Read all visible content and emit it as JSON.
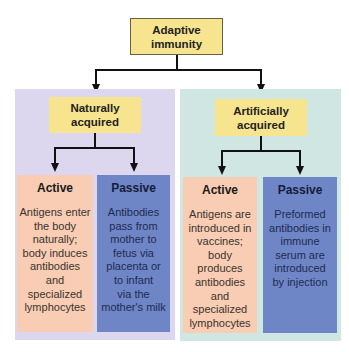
{
  "diagram": {
    "root": {
      "label": "Adaptive\nimmunity",
      "color": "#f7e48e"
    },
    "branches": [
      {
        "id": "natural",
        "label": "Naturally\nacquired",
        "panel_color": "#dcd6ef",
        "children": [
          {
            "type": "Active",
            "description": "Antigens enter\nthe body\nnaturally;\nbody induces\nantibodies\nand\nspecialized\nlymphocytes",
            "color": "#f8cdb3"
          },
          {
            "type": "Passive",
            "description": "Antibodies\npass from\nmother to\nfetus via\nplacenta or\nto infant\nvia the\nmother's milk",
            "color": "#6f86c6"
          }
        ]
      },
      {
        "id": "artificial",
        "label": "Artificially\nacquired",
        "panel_color": "#cfe6e2",
        "children": [
          {
            "type": "Active",
            "description": "Antigens are\nintroduced in\nvaccines;\nbody\nproduces\nantibodies\nand\nspecialized\nlymphocytes",
            "color": "#f8cdb3"
          },
          {
            "type": "Passive",
            "description": "Preformed\nantibodies in\nimmune\nserum are\nintroduced\nby injection",
            "color": "#6f86c6"
          }
        ]
      }
    ]
  }
}
